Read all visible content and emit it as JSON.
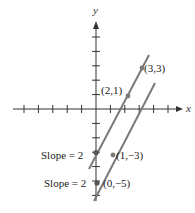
{
  "diagram": {
    "type": "coordinate-plane-parallel-lines",
    "axes": {
      "x_label": "x",
      "y_label": "y",
      "unit_px": 14.4,
      "origin_px": [
        96,
        109
      ],
      "x_ticks": [
        -5,
        -4,
        -3,
        -2,
        -1,
        1,
        2,
        3,
        4,
        5
      ],
      "y_ticks": [
        -6,
        -5,
        -4,
        -3,
        -2,
        -1,
        1,
        2,
        3,
        4,
        5
      ]
    },
    "lines": [
      {
        "name": "line-1",
        "equation": "y = 2x - 3",
        "slope": 2,
        "color": "#7a7a7a",
        "points": [
          {
            "label": "(3,3)",
            "x": 3,
            "y": 3
          },
          {
            "label": "(2,1)",
            "x": 2,
            "y": 1
          }
        ],
        "slope_label": "Slope = 2",
        "y_intercept_point": {
          "x": 0,
          "y": -3
        }
      },
      {
        "name": "line-2",
        "equation": "y = 2x - 5",
        "slope": 2,
        "color": "#7a7a7a",
        "points": [
          {
            "label": "(1,−3)",
            "x": 1,
            "y": -3
          },
          {
            "label": "(0,−5)",
            "x": 0,
            "y": -5
          }
        ],
        "slope_label": "Slope = 2"
      }
    ],
    "labels": {
      "p33": "(3,3)",
      "p21": "(2,1)",
      "p1m3": "(1,−3)",
      "p0m5": "(0,−5)",
      "slope1": "Slope = 2",
      "slope2": "Slope = 2"
    },
    "colors": {
      "axis": "#333333",
      "line": "#7a7a7a",
      "text": "#222222"
    }
  }
}
